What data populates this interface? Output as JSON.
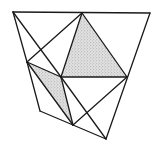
{
  "diagram": {
    "type": "geometric-dissection",
    "stroke_color": "#1a1a1a",
    "shade_color": "#bdbdbd",
    "background": "#ffffff",
    "vertices": {
      "A": [
        13,
        12
      ],
      "B": [
        82,
        13
      ],
      "C": [
        150,
        13
      ],
      "D": [
        27,
        62
      ],
      "E": [
        61,
        77
      ],
      "F": [
        127,
        77
      ],
      "G": [
        40,
        111
      ],
      "H": [
        73,
        125
      ],
      "I": [
        106,
        139
      ]
    },
    "edges": [
      [
        "A",
        "C"
      ],
      [
        "C",
        "I"
      ],
      [
        "A",
        "D"
      ],
      [
        "D",
        "G"
      ],
      [
        "G",
        "H"
      ],
      [
        "H",
        "I"
      ],
      [
        "A",
        "E"
      ],
      [
        "B",
        "D"
      ],
      [
        "B",
        "E"
      ],
      [
        "B",
        "F"
      ],
      [
        "E",
        "F"
      ],
      [
        "D",
        "E"
      ],
      [
        "D",
        "H"
      ],
      [
        "E",
        "H"
      ],
      [
        "E",
        "I"
      ],
      [
        "H",
        "F"
      ]
    ],
    "shaded_regions": [
      {
        "name": "large-shaded-triangle",
        "points": [
          "B",
          "E",
          "F"
        ]
      },
      {
        "name": "small-shaded-triangle",
        "points": [
          "D",
          "E",
          "H"
        ]
      }
    ]
  }
}
